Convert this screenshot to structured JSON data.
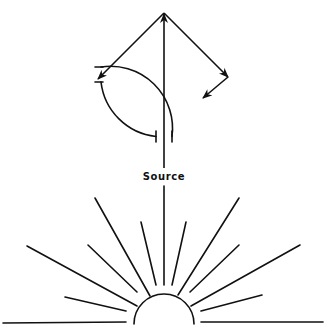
{
  "diagram": {
    "label": "Source",
    "stroke_color": "#111111",
    "background": "#ffffff",
    "elements": {
      "upper_circle": {
        "description": "circular path of reflected rays with two gaps marked by end ticks",
        "center": [
          164,
          75
        ],
        "radius": 62
      },
      "arrows": [
        {
          "name": "vertical-arrow",
          "from": [
            164,
            168
          ],
          "to": [
            164,
            13
          ]
        },
        {
          "name": "left-reflected-arrow",
          "from": [
            164,
            13
          ],
          "to": [
            98,
            79
          ]
        },
        {
          "name": "right-reflected-arrow",
          "from": [
            164,
            13
          ],
          "to": [
            228,
            77
          ]
        },
        {
          "name": "inner-reflected-arrow",
          "from": [
            228,
            77
          ],
          "to": [
            203,
            98
          ]
        }
      ],
      "source_semicircle": {
        "center": [
          164,
          323
        ],
        "radius": 30
      },
      "rays": [
        {
          "from": [
            3,
            323
          ],
          "to": [
            126,
            322
          ]
        },
        {
          "from": [
            65,
            297
          ],
          "to": [
            126,
            311
          ]
        },
        {
          "from": [
            27,
            246
          ],
          "to": [
            137,
            306
          ]
        },
        {
          "from": [
            88,
            245
          ],
          "to": [
            137,
            292
          ]
        },
        {
          "from": [
            95,
            198
          ],
          "to": [
            150,
            296
          ]
        },
        {
          "from": [
            141,
            222
          ],
          "to": [
            156,
            285
          ]
        },
        {
          "from": [
            164,
            186
          ],
          "to": [
            164,
            285
          ]
        },
        {
          "from": [
            186,
            222
          ],
          "to": [
            172,
            285
          ]
        },
        {
          "from": [
            239,
            198
          ],
          "to": [
            178,
            295
          ]
        },
        {
          "from": [
            239,
            245
          ],
          "to": [
            190,
            292
          ]
        },
        {
          "from": [
            300,
            245
          ],
          "to": [
            191,
            306
          ]
        },
        {
          "from": [
            262,
            295
          ],
          "to": [
            201,
            311
          ]
        },
        {
          "from": [
            201,
            322
          ],
          "to": [
            323,
            322
          ]
        }
      ]
    }
  }
}
